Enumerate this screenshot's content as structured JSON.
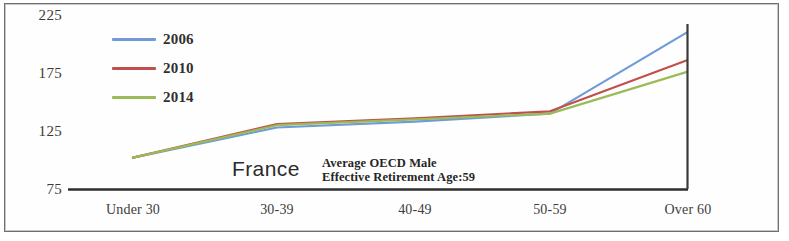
{
  "chart_data": {
    "type": "line",
    "title": "",
    "subtitle": "",
    "xlabel": "",
    "ylabel": "",
    "categories": [
      "Under 30",
      "30-39",
      "40-49",
      "50-59",
      "Over 60"
    ],
    "yticks": [
      225,
      175,
      125,
      75
    ],
    "ylim": [
      75,
      232
    ],
    "grid": false,
    "legend_position": "top-left-inside",
    "series": [
      {
        "name": "2006",
        "color": "#6f9bd8",
        "values": [
          102,
          128,
          133,
          140,
          210
        ]
      },
      {
        "name": "2010",
        "color": "#c0504d",
        "values": [
          102,
          131,
          136,
          142,
          186
        ]
      },
      {
        "name": "2014",
        "color": "#9bbb59",
        "values": [
          102,
          130,
          135,
          140,
          176
        ]
      }
    ],
    "annotations": [
      {
        "name": "country",
        "text": "France"
      },
      {
        "name": "oecd-note-line1",
        "text": "Average OECD Male"
      },
      {
        "name": "oecd-note-line2",
        "text": "Effective Retirement Age:59"
      }
    ]
  },
  "legend": {
    "items": [
      {
        "label": "2006",
        "color": "#6f9bd8"
      },
      {
        "label": "2010",
        "color": "#c0504d"
      },
      {
        "label": "2014",
        "color": "#9bbb59"
      }
    ]
  },
  "axis": {
    "y_labels": [
      "225",
      "175",
      "125",
      "75"
    ],
    "x_labels": [
      "Under 30",
      "30-39",
      "40-49",
      "50-59",
      "Over 60"
    ]
  },
  "annotation": {
    "country": "France",
    "note_line1": "Average OECD Male",
    "note_line2": "Effective Retirement Age:59"
  },
  "colors": {
    "series_2006": "#6f9bd8",
    "series_2010": "#c0504d",
    "series_2014": "#9bbb59",
    "axis": "#2e2e2e",
    "frame": "#6f6f6f"
  }
}
